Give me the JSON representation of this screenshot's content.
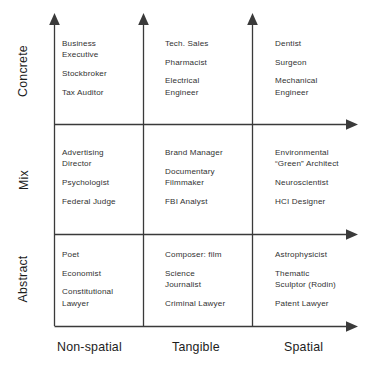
{
  "diagram": {
    "type": "3x3 matrix of occupations",
    "row_axis_labels": [
      "Concrete",
      "Mix",
      "Abstract"
    ],
    "column_axis_labels": [
      "Non-spatial",
      "Tangible",
      "Spatial"
    ],
    "rows": [
      {
        "label": "Concrete",
        "cells": [
          {
            "entries": [
              "Business\nExecutive",
              "Stockbroker",
              "Tax Auditor"
            ]
          },
          {
            "entries": [
              "Tech. Sales",
              "Pharmacist",
              "Electrical\nEngineer"
            ]
          },
          {
            "entries": [
              "Dentist",
              "Surgeon",
              "Mechanical\nEngineer"
            ]
          }
        ]
      },
      {
        "label": "Mix",
        "cells": [
          {
            "entries": [
              "Advertising\nDirector",
              "Psychologist",
              "Federal Judge"
            ]
          },
          {
            "entries": [
              "Brand Manager",
              "Documentary\nFilmmaker",
              "FBI Analyst"
            ]
          },
          {
            "entries": [
              "Environmental\n“Green” Architect",
              "Neuroscientist",
              "HCI Designer"
            ]
          }
        ]
      },
      {
        "label": "Abstract",
        "cells": [
          {
            "entries": [
              "Poet",
              "Economist",
              "Constitutional\nLawyer"
            ]
          },
          {
            "entries": [
              "Composer: film",
              "Science\nJournalist",
              "Criminal Lawyer"
            ]
          },
          {
            "entries": [
              "Astrophysicist",
              "Thematic\nSculptor (Rodin)",
              "Patent Lawyer"
            ]
          }
        ]
      }
    ],
    "colors": {
      "line": "#3a3a3a",
      "text": "#323232",
      "label_text": "#1d1d1d",
      "background": "#ffffff"
    }
  }
}
